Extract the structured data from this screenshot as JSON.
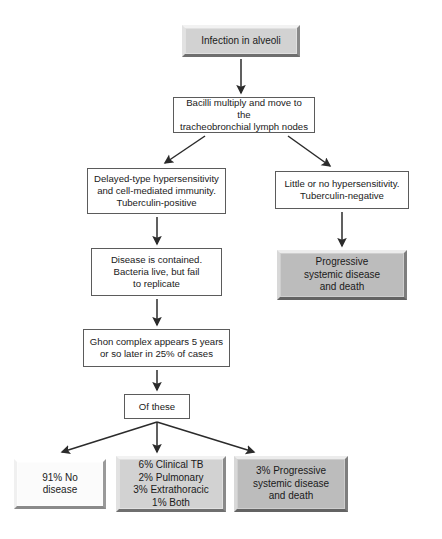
{
  "diagram": {
    "colors": {
      "outline": "#5b5b5b",
      "arrow": "#2b2b2b",
      "box_light_gray": "#d2d2d2",
      "box_mid_gray": "#bcbcbc",
      "box_white": "#fbfbfb",
      "background": "#ffffff"
    },
    "nodes": [
      {
        "id": "infection",
        "name": "node-infection-in-alveoli",
        "style": "bevel-lightgray",
        "text": "Infection in alveoli",
        "x": 182,
        "y": 25,
        "w": 118,
        "h": 32
      },
      {
        "id": "bacilli",
        "name": "node-bacilli-multiply",
        "style": "plain",
        "text": "Bacilli multiply and move to the\ntracheobronchial lymph nodes",
        "x": 173,
        "y": 97,
        "w": 142,
        "h": 36
      },
      {
        "id": "delayed",
        "name": "node-delayed-type-hypersensitivity",
        "style": "plain",
        "text": "Delayed-type hypersensitivity\nand cell-mediated immunity.\nTuberculin-positive",
        "x": 87,
        "y": 168,
        "w": 139,
        "h": 46
      },
      {
        "id": "little",
        "name": "node-little-or-no-hypersensitivity",
        "style": "plain",
        "text": "Little or no hypersensitivity.\nTuberculin-negative",
        "x": 275,
        "y": 171,
        "w": 134,
        "h": 38
      },
      {
        "id": "contained",
        "name": "node-disease-is-contained",
        "style": "plain",
        "text": "Disease is contained.\nBacteria live, but fail\nto replicate",
        "x": 91,
        "y": 248,
        "w": 131,
        "h": 48
      },
      {
        "id": "progressive1",
        "name": "node-progressive-systemic-disease-and-death",
        "style": "bevel-midgray",
        "text": "Progressive\nsystemic disease\nand death",
        "x": 277,
        "y": 250,
        "w": 130,
        "h": 50
      },
      {
        "id": "ghon",
        "name": "node-ghon-complex",
        "style": "plain",
        "text": "Ghon complex appears 5 years\nor so later in 25% of cases",
        "x": 83,
        "y": 329,
        "w": 147,
        "h": 38
      },
      {
        "id": "ofthese",
        "name": "node-of-these",
        "style": "plain",
        "text": "Of these",
        "x": 124,
        "y": 394,
        "w": 66,
        "h": 25
      },
      {
        "id": "nodisease",
        "name": "node-91-percent-no-disease",
        "style": "bevel-white",
        "text": "91% No\ndisease",
        "x": 14,
        "y": 459,
        "w": 92,
        "h": 50
      },
      {
        "id": "clinicaltb",
        "name": "node-clinical-tb-breakdown",
        "style": "bevel-lightgray",
        "text": "6% Clinical TB\n2% Pulmonary\n3% Extrathoracic\n1% Both",
        "x": 116,
        "y": 456,
        "w": 110,
        "h": 56
      },
      {
        "id": "progressive2",
        "name": "node-3-percent-progressive-systemic-disease",
        "style": "bevel-midgray",
        "text": "3% Progressive\nsystemic disease\nand death",
        "x": 234,
        "y": 456,
        "w": 114,
        "h": 56
      }
    ],
    "connectors": [
      {
        "name": "arrow-infection-to-bacilli",
        "kind": "straight-down",
        "from": "infection",
        "to": "bacilli"
      },
      {
        "name": "arrow-bacilli-to-delayed",
        "kind": "diagonal-left",
        "from": "bacilli",
        "to": "delayed"
      },
      {
        "name": "arrow-bacilli-to-little",
        "kind": "diagonal-right",
        "from": "bacilli",
        "to": "little"
      },
      {
        "name": "arrow-delayed-to-contained",
        "kind": "straight-down",
        "from": "delayed",
        "to": "contained"
      },
      {
        "name": "arrow-little-to-progressive",
        "kind": "straight-down",
        "from": "little",
        "to": "progressive1"
      },
      {
        "name": "arrow-contained-to-ghon",
        "kind": "straight-down",
        "from": "contained",
        "to": "ghon"
      },
      {
        "name": "arrow-ghon-to-ofthese",
        "kind": "straight-down",
        "from": "ghon",
        "to": "ofthese"
      },
      {
        "name": "arrow-ofthese-to-nodisease",
        "kind": "fan-left",
        "from": "ofthese",
        "to": "nodisease"
      },
      {
        "name": "arrow-ofthese-to-clinicaltb",
        "kind": "fan-center",
        "from": "ofthese",
        "to": "clinicaltb"
      },
      {
        "name": "arrow-ofthese-to-progressive2",
        "kind": "fan-right",
        "from": "ofthese",
        "to": "progressive2"
      }
    ]
  }
}
